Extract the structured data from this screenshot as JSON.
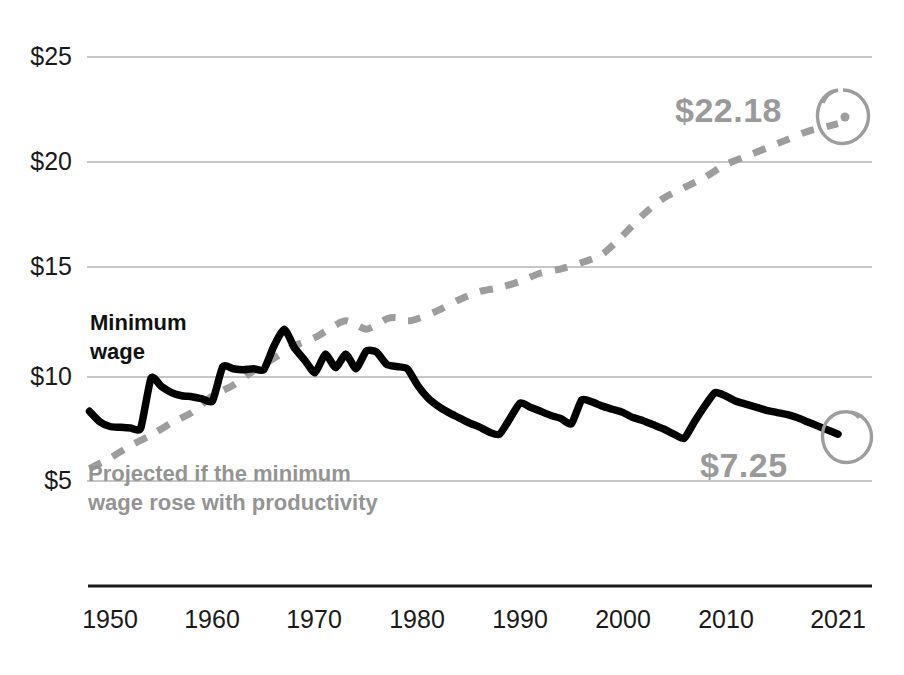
{
  "chart_data": {
    "type": "line",
    "title": "",
    "subtitle": "",
    "xlabel": "",
    "ylabel": "",
    "xlim": [
      1948,
      2021
    ],
    "ylim": [
      2.5,
      26.5
    ],
    "grid": "horizontal",
    "legend": "inline-labels",
    "y_ticks": [
      "$25",
      "$20",
      "$15",
      "$10",
      "$5"
    ],
    "y_tick_values": [
      25,
      20,
      15,
      10,
      5
    ],
    "x_ticks": [
      "1950",
      "1960",
      "1970",
      "1980",
      "1990",
      "2000",
      "2010",
      "2021"
    ],
    "x_tick_values": [
      1950,
      1960,
      1970,
      1980,
      1990,
      2000,
      2010,
      2021
    ],
    "series": [
      {
        "name": "Minimum wage",
        "label": "Minimum\nwage",
        "style": "solid",
        "color": "#000000",
        "end_value": 7.25,
        "end_label": "$7.25",
        "x": [
          1948,
          1949,
          1950,
          1951,
          1952,
          1953,
          1954,
          1955,
          1956,
          1957,
          1958,
          1959,
          1960,
          1961,
          1962,
          1963,
          1964,
          1965,
          1966,
          1967,
          1968,
          1969,
          1970,
          1971,
          1972,
          1973,
          1974,
          1975,
          1976,
          1977,
          1978,
          1979,
          1980,
          1981,
          1982,
          1983,
          1984,
          1985,
          1986,
          1987,
          1988,
          1989,
          1990,
          1991,
          1992,
          1993,
          1994,
          1995,
          1996,
          1997,
          1998,
          1999,
          2000,
          2001,
          2002,
          2003,
          2004,
          2005,
          2006,
          2007,
          2008,
          2009,
          2010,
          2011,
          2012,
          2013,
          2014,
          2015,
          2016,
          2017,
          2018,
          2019,
          2020,
          2021
        ],
        "y": [
          8.35,
          7.85,
          7.62,
          7.58,
          7.55,
          7.55,
          9.95,
          9.55,
          9.25,
          9.1,
          9.05,
          8.95,
          8.85,
          10.5,
          10.4,
          10.35,
          10.4,
          10.35,
          11.5,
          12.3,
          11.4,
          10.8,
          10.2,
          11.1,
          10.45,
          11.1,
          10.4,
          11.25,
          11.2,
          10.6,
          10.5,
          10.4,
          9.6,
          9.0,
          8.6,
          8.3,
          8.05,
          7.8,
          7.6,
          7.35,
          7.25,
          8.0,
          8.75,
          8.55,
          8.35,
          8.15,
          8.0,
          7.75,
          8.9,
          8.8,
          8.6,
          8.45,
          8.3,
          8.05,
          7.9,
          7.7,
          7.5,
          7.25,
          7.05,
          7.85,
          8.6,
          9.25,
          9.1,
          8.85,
          8.7,
          8.55,
          8.4,
          8.3,
          8.2,
          8.05,
          7.85,
          7.65,
          7.45,
          7.25
        ]
      },
      {
        "name": "Projected if the minimum wage rose with productivity",
        "label": "Projected if the minimum\nwage rose with productivity",
        "style": "dashed",
        "color": "#9d9d9d",
        "end_value": 22.18,
        "end_label": "$22.18",
        "x": [
          1948,
          1950,
          1952,
          1954,
          1956,
          1958,
          1960,
          1962,
          1964,
          1966,
          1968,
          1970,
          1972,
          1973,
          1974,
          1975,
          1976,
          1977,
          1978,
          1979,
          1980,
          1982,
          1984,
          1986,
          1988,
          1990,
          1992,
          1994,
          1996,
          1998,
          2000,
          2002,
          2004,
          2006,
          2008,
          2010,
          2012,
          2014,
          2016,
          2018,
          2020,
          2021
        ],
        "y": [
          5.6,
          6.1,
          6.7,
          7.2,
          7.8,
          8.3,
          9.1,
          9.6,
          10.3,
          10.9,
          11.5,
          11.9,
          12.5,
          12.7,
          12.5,
          12.3,
          12.5,
          12.8,
          12.85,
          12.7,
          12.8,
          13.2,
          13.7,
          14.1,
          14.3,
          14.6,
          15.0,
          15.2,
          15.5,
          15.9,
          16.8,
          17.8,
          18.6,
          19.1,
          19.6,
          20.2,
          20.6,
          21.0,
          21.4,
          21.8,
          22.05,
          22.18
        ]
      }
    ],
    "annotations": [
      {
        "name": "projected-endpoint-callout",
        "text": "$22.18",
        "at_x": 2021,
        "at_y": 22.18,
        "circled": true
      },
      {
        "name": "minwage-endpoint-callout",
        "text": "$7.25",
        "at_x": 2021,
        "at_y": 7.25,
        "circled": true
      }
    ]
  },
  "labels": {
    "minimum_wage_line1": "Minimum",
    "minimum_wage_line2": "wage",
    "projected_line1": "Projected if the minimum",
    "projected_line2": "wage rose with productivity",
    "callout_projected": "$22.18",
    "callout_minwage": "$7.25"
  },
  "y_ticks": {
    "t0": "$25",
    "t1": "$20",
    "t2": "$15",
    "t3": "$10",
    "t4": "$5"
  },
  "x_ticks": {
    "t0": "1950",
    "t1": "1960",
    "t2": "1970",
    "t3": "1980",
    "t4": "1990",
    "t5": "2000",
    "t6": "2010",
    "t7": "2021"
  },
  "colors": {
    "minimum_wage": "#000000",
    "projected": "#9d9d9d",
    "gridline": "#b4b4b4",
    "axis": "#1a1a1a",
    "background": "#ffffff"
  }
}
